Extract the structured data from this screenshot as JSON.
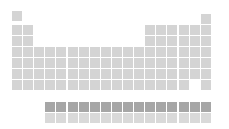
{
  "colors": {
    "background": "#ffffff",
    "cell": "#d4d4d4",
    "lanthanide_cell": "#a6a6a6",
    "actinide_cell": "#d9d9d9"
  },
  "layout": {
    "origin_x": 12,
    "col_pitch": 11.1,
    "cell_size": 10,
    "main_row_tops": [
      11,
      25,
      36,
      47,
      58,
      69,
      80
    ],
    "lanthanide_row_top": 102,
    "actinide_row_top": 113,
    "f_block_start_col": 4,
    "f_block_count": 15,
    "he_top": 14
  },
  "main_rows": [
    {
      "period": 1,
      "cols": [
        1,
        18
      ]
    },
    {
      "period": 2,
      "cols": [
        1,
        2,
        13,
        14,
        15,
        16,
        17,
        18
      ]
    },
    {
      "period": 3,
      "cols": [
        1,
        2,
        13,
        14,
        15,
        16,
        17,
        18
      ]
    },
    {
      "period": 4,
      "cols": [
        1,
        2,
        3,
        4,
        5,
        6,
        7,
        8,
        9,
        10,
        11,
        12,
        13,
        14,
        15,
        16,
        17,
        18
      ]
    },
    {
      "period": 5,
      "cols": [
        1,
        2,
        3,
        4,
        5,
        6,
        7,
        8,
        9,
        10,
        11,
        12,
        13,
        14,
        15,
        16,
        17,
        18
      ]
    },
    {
      "period": 6,
      "cols": [
        1,
        2,
        3,
        4,
        5,
        6,
        7,
        8,
        9,
        10,
        11,
        12,
        13,
        14,
        15,
        16,
        17,
        18
      ]
    },
    {
      "period": 7,
      "cols": [
        1,
        2,
        3,
        4,
        5,
        6,
        7,
        8,
        9,
        10,
        11,
        12,
        13,
        14,
        15,
        16,
        18
      ]
    }
  ],
  "f_block": [
    {
      "series": "lanthanides",
      "count": 15,
      "style": "dark"
    },
    {
      "series": "actinides",
      "count": 15,
      "style": "light2"
    }
  ]
}
